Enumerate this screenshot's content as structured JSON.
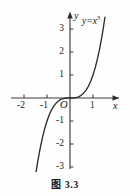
{
  "figure": {
    "caption": "图 3.3",
    "background_color": "#fefefe",
    "axis_color": "#3a3a3a",
    "curve_color": "#2b2b2b",
    "text_color": "#141414"
  },
  "axes": {
    "x_axis_name": "x",
    "y_axis_name": "y",
    "origin_label": "O",
    "x_ticks": [
      {
        "label": "-2",
        "value": -2
      },
      {
        "label": "-1",
        "value": -1
      },
      {
        "label": "1",
        "value": 1
      }
    ],
    "y_ticks": [
      {
        "label": "3",
        "value": 3
      },
      {
        "label": "2",
        "value": 2
      },
      {
        "label": "1",
        "value": 1
      },
      {
        "label": "-1",
        "value": -1
      },
      {
        "label": "-2",
        "value": -2
      },
      {
        "label": "-3",
        "value": -3
      }
    ]
  },
  "curve": {
    "equation_base": "y=x",
    "equation_exponent": "3"
  },
  "chart_data": {
    "type": "line",
    "title": "图 3.3",
    "xlabel": "x",
    "ylabel": "y",
    "grid": false,
    "legend": null,
    "annotations": [
      {
        "text": "y=x³",
        "x": 1.25,
        "y": 3.6
      },
      {
        "text": "O",
        "x": -0.18,
        "y": -0.3
      }
    ],
    "xlim": [
      -2.6,
      2.2
    ],
    "ylim": [
      -3.4,
      3.7
    ],
    "xticks": [
      -2,
      -1,
      1
    ],
    "yticks": [
      -3,
      -2,
      -1,
      1,
      2,
      3
    ],
    "series": [
      {
        "name": "y=x^3",
        "x": [
          -1.49,
          -1.4,
          -1.3,
          -1.2,
          -1.1,
          -1.0,
          -0.9,
          -0.8,
          -0.7,
          -0.6,
          -0.5,
          -0.4,
          -0.3,
          -0.2,
          -0.1,
          0.0,
          0.1,
          0.2,
          0.3,
          0.4,
          0.5,
          0.6,
          0.7,
          0.8,
          0.9,
          1.0,
          1.1,
          1.2,
          1.3,
          1.4,
          1.52
        ],
        "y": [
          -3.31,
          -2.74,
          -2.2,
          -1.73,
          -1.33,
          -1.0,
          -0.73,
          -0.51,
          -0.34,
          -0.22,
          -0.13,
          -0.06,
          -0.03,
          -0.01,
          0.0,
          0.0,
          0.0,
          0.01,
          0.03,
          0.06,
          0.13,
          0.22,
          0.34,
          0.51,
          0.73,
          1.0,
          1.33,
          1.73,
          2.2,
          2.74,
          3.51
        ]
      }
    ]
  }
}
